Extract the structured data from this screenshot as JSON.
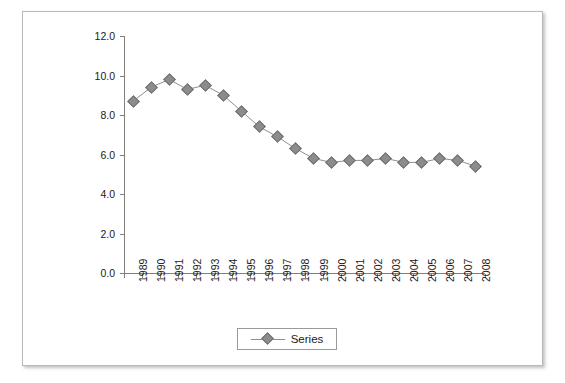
{
  "chart_data": {
    "type": "line",
    "title": "",
    "xlabel": "",
    "ylabel": "",
    "grid": false,
    "legend_position": "bottom-center",
    "ylim": [
      0.0,
      12.0
    ],
    "ytick_step": 2.0,
    "ytick_labels": [
      "12.0",
      "10.0",
      "8.0",
      "6.0",
      "4.0",
      "2.0",
      "0.0"
    ],
    "ytick_values": [
      12.0,
      10.0,
      8.0,
      6.0,
      4.0,
      2.0,
      0.0
    ],
    "categories": [
      "1989",
      "1990",
      "1991",
      "1992",
      "1993",
      "1994",
      "1995",
      "1996",
      "1997",
      "1998",
      "1999",
      "2000",
      "2001",
      "2002",
      "2003",
      "2004",
      "2005",
      "2006",
      "2007",
      "2008"
    ],
    "series": [
      {
        "name": "Series",
        "marker": "diamond",
        "marker_color": "#8c8c8c",
        "line_color": "#909090",
        "values": [
          8.7,
          9.4,
          9.8,
          9.3,
          9.5,
          9.0,
          8.2,
          7.4,
          6.9,
          6.3,
          5.8,
          5.6,
          5.7,
          5.7,
          5.8,
          5.6,
          5.6,
          5.8,
          5.7,
          5.4
        ]
      }
    ],
    "legend": [
      {
        "label": "Series",
        "marker": "diamond",
        "color": "#8c8c8c"
      }
    ]
  }
}
